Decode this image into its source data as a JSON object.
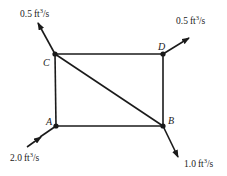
{
  "diagram": {
    "type": "pipe-network",
    "colors": {
      "line": "#1a1a1a",
      "background": "#ffffff"
    },
    "nodes": [
      {
        "id": "A",
        "label": "A",
        "x": 56,
        "y": 126
      },
      {
        "id": "B",
        "label": "B",
        "x": 163,
        "y": 126
      },
      {
        "id": "C",
        "label": "C",
        "x": 55,
        "y": 54
      },
      {
        "id": "D",
        "label": "D",
        "x": 163,
        "y": 54
      }
    ],
    "edges": [
      {
        "from": "C",
        "to": "D"
      },
      {
        "from": "D",
        "to": "B"
      },
      {
        "from": "B",
        "to": "A"
      },
      {
        "from": "A",
        "to": "C"
      },
      {
        "from": "C",
        "to": "B"
      }
    ],
    "flows": [
      {
        "node": "C",
        "direction": "out",
        "value": "0.5",
        "unit": "ft",
        "exp": "3",
        "per": "/s"
      },
      {
        "node": "D",
        "direction": "out",
        "value": "0.5",
        "unit": "ft",
        "exp": "3",
        "per": "/s"
      },
      {
        "node": "A",
        "direction": "in",
        "value": "2.0",
        "unit": "ft",
        "exp": "3",
        "per": "/s"
      },
      {
        "node": "B",
        "direction": "out",
        "value": "1.0",
        "unit": "ft",
        "exp": "3",
        "per": "/s"
      }
    ]
  }
}
